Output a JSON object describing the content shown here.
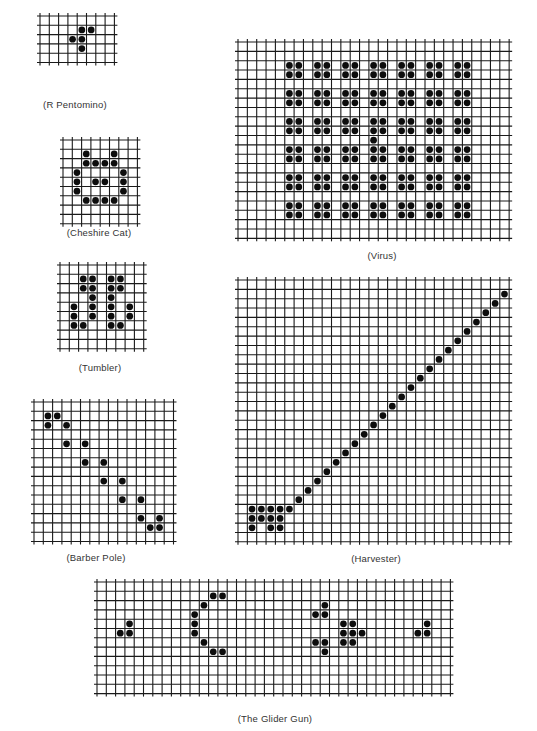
{
  "style": {
    "line_color": "#1a1a1a",
    "dot_color": "#0d0d0d",
    "caption_color": "#333333"
  },
  "patterns": [
    {
      "id": "r-pentomino",
      "caption": "(R Pentomino)",
      "x": 40,
      "y": 16,
      "cols": 8,
      "rows": 5,
      "cell": 9.3,
      "caption_x": 75,
      "caption_y": 99,
      "cells": [
        [
          1,
          4
        ],
        [
          1,
          5
        ],
        [
          2,
          3
        ],
        [
          2,
          4
        ],
        [
          3,
          4
        ]
      ]
    },
    {
      "id": "cheshire-cat",
      "caption": "(Cheshire Cat)",
      "x": 63,
      "y": 140,
      "cols": 8,
      "rows": 9,
      "cell": 9.3,
      "caption_x": 99,
      "caption_y": 227,
      "cells": [
        [
          1,
          2
        ],
        [
          1,
          5
        ],
        [
          2,
          2
        ],
        [
          2,
          3
        ],
        [
          2,
          4
        ],
        [
          2,
          5
        ],
        [
          3,
          1
        ],
        [
          3,
          6
        ],
        [
          4,
          1
        ],
        [
          4,
          3
        ],
        [
          4,
          4
        ],
        [
          4,
          6
        ],
        [
          5,
          1
        ],
        [
          5,
          6
        ],
        [
          6,
          2
        ],
        [
          6,
          3
        ],
        [
          6,
          4
        ],
        [
          6,
          5
        ]
      ]
    },
    {
      "id": "tumbler",
      "caption": "(Tumbler)",
      "x": 60,
      "y": 265,
      "cols": 9,
      "rows": 9,
      "cell": 9.3,
      "caption_x": 100,
      "caption_y": 362,
      "cells": [
        [
          1,
          2
        ],
        [
          1,
          3
        ],
        [
          1,
          5
        ],
        [
          1,
          6
        ],
        [
          2,
          2
        ],
        [
          2,
          3
        ],
        [
          2,
          5
        ],
        [
          2,
          6
        ],
        [
          3,
          3
        ],
        [
          3,
          5
        ],
        [
          4,
          1
        ],
        [
          4,
          3
        ],
        [
          4,
          5
        ],
        [
          4,
          7
        ],
        [
          5,
          1
        ],
        [
          5,
          3
        ],
        [
          5,
          5
        ],
        [
          5,
          7
        ],
        [
          6,
          1
        ],
        [
          6,
          2
        ],
        [
          6,
          5
        ],
        [
          6,
          6
        ]
      ]
    },
    {
      "id": "barber-pole",
      "caption": "(Barber Pole)",
      "x": 34,
      "y": 402,
      "cols": 15,
      "rows": 15,
      "cell": 9.3,
      "caption_x": 96,
      "caption_y": 552,
      "cells": [
        [
          1,
          1
        ],
        [
          1,
          2
        ],
        [
          2,
          1
        ],
        [
          2,
          3
        ],
        [
          4,
          3
        ],
        [
          4,
          5
        ],
        [
          6,
          5
        ],
        [
          6,
          7
        ],
        [
          8,
          7
        ],
        [
          8,
          9
        ],
        [
          10,
          9
        ],
        [
          10,
          11
        ],
        [
          12,
          11
        ],
        [
          12,
          13
        ],
        [
          13,
          12
        ],
        [
          13,
          13
        ]
      ]
    },
    {
      "id": "virus",
      "caption": "(Virus)",
      "x": 238,
      "y": 42,
      "cols": 29,
      "rows": 21,
      "cell": 9.35,
      "caption_x": 382,
      "caption_y": 250,
      "blocks": {
        "col_starts": [
          5,
          8,
          11,
          14,
          17,
          20,
          23
        ],
        "row_starts": [
          2,
          5,
          8,
          11,
          14,
          17
        ]
      },
      "extra_cells": [
        [
          10,
          14
        ]
      ]
    },
    {
      "id": "harvester",
      "caption": "(Harvester)",
      "x": 238,
      "y": 280,
      "cols": 29,
      "rows": 28,
      "cell": 9.35,
      "caption_x": 376,
      "caption_y": 553,
      "cells": [
        [
          24,
          1
        ],
        [
          24,
          2
        ],
        [
          24,
          3
        ],
        [
          24,
          4
        ],
        [
          24,
          5
        ],
        [
          25,
          1
        ],
        [
          25,
          2
        ],
        [
          25,
          3
        ],
        [
          25,
          4
        ],
        [
          26,
          1
        ],
        [
          26,
          3
        ],
        [
          26,
          4
        ],
        [
          23,
          6
        ],
        [
          22,
          7
        ],
        [
          21,
          8
        ],
        [
          20,
          9
        ],
        [
          19,
          10
        ],
        [
          18,
          11
        ],
        [
          17,
          12
        ],
        [
          16,
          13
        ],
        [
          15,
          14
        ],
        [
          14,
          15
        ],
        [
          13,
          16
        ],
        [
          12,
          17
        ],
        [
          11,
          18
        ],
        [
          10,
          19
        ],
        [
          9,
          20
        ],
        [
          8,
          21
        ],
        [
          7,
          22
        ],
        [
          6,
          23
        ],
        [
          5,
          24
        ],
        [
          4,
          25
        ],
        [
          3,
          26
        ],
        [
          2,
          27
        ],
        [
          1,
          28
        ]
      ]
    },
    {
      "id": "glider-gun",
      "caption": "(The Glider Gun)",
      "x": 97,
      "y": 582,
      "cols": 38,
      "rows": 12,
      "cell": 9.3,
      "caption_x": 275,
      "caption_y": 713,
      "cells": [
        [
          1,
          12
        ],
        [
          1,
          13
        ],
        [
          2,
          11
        ],
        [
          3,
          10
        ],
        [
          4,
          10
        ],
        [
          5,
          10
        ],
        [
          6,
          11
        ],
        [
          7,
          12
        ],
        [
          7,
          13
        ],
        [
          4,
          3
        ],
        [
          5,
          2
        ],
        [
          5,
          3
        ],
        [
          2,
          24
        ],
        [
          3,
          23
        ],
        [
          3,
          24
        ],
        [
          6,
          23
        ],
        [
          6,
          24
        ],
        [
          7,
          24
        ],
        [
          4,
          26
        ],
        [
          4,
          27
        ],
        [
          5,
          26
        ],
        [
          5,
          27
        ],
        [
          5,
          28
        ],
        [
          6,
          26
        ],
        [
          6,
          27
        ],
        [
          5,
          34
        ],
        [
          5,
          35
        ],
        [
          4,
          35
        ]
      ]
    }
  ]
}
